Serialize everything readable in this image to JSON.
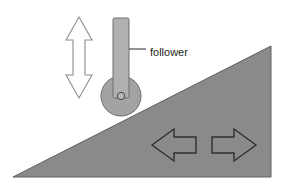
{
  "diagram": {
    "background_color": "#ffffff",
    "labels": {
      "follower": "follower"
    },
    "colors": {
      "wedge_fill": "#8a8a8a",
      "wedge_stroke": "#5e5e5e",
      "rod_fill": "#b0b0b0",
      "rod_stroke": "#6e6e6e",
      "wheel_fill": "#a3a3a3",
      "wheel_stroke": "#6e6e6e",
      "hub_fill": "#b5b5b5",
      "hub_stroke": "#4a4a4a",
      "vertical_arrow_fill": "#ffffff",
      "vertical_arrow_stroke": "#8d8d8d",
      "horizontal_arrow_fill": "#8a8a8a",
      "horizontal_arrow_stroke": "#2f2f2f",
      "leader_line": "#3a3a3a",
      "text": "#231f20"
    },
    "shapes": {
      "wedge": {
        "name": "inclined-wedge-triangle",
        "points": "13,177 271,177 271,46"
      },
      "follower_rod": {
        "name": "follower-rod",
        "x": 113,
        "y": 18,
        "width": 16,
        "height": 80,
        "rx": 1.5
      },
      "follower_wheel": {
        "name": "follower-wheel",
        "cx": 121,
        "cy": 96,
        "r": 20
      },
      "follower_hub": {
        "name": "follower-wheel-hub",
        "cx": 121,
        "cy": 96,
        "r": 3.7
      },
      "vertical_arrow": {
        "name": "vertical-double-arrow",
        "points": "79,17 92,40 85,40 85,75 92,75 79,98 66,75 73,75 73,40 66,40"
      },
      "arrow_left": {
        "name": "left-arrow",
        "points": "152,145 174,129 174,137 196,137 196,153 174,153 174,161"
      },
      "arrow_right": {
        "name": "right-arrow",
        "points": "256,145 234,129 234,137 212,137 212,153 234,153 234,161"
      },
      "leader_line": {
        "name": "follower-leader-line",
        "x1": 129,
        "y1": 49,
        "x2": 146,
        "y2": 49
      }
    },
    "label_positions": {
      "follower": {
        "x": 150,
        "y": 53
      }
    }
  }
}
